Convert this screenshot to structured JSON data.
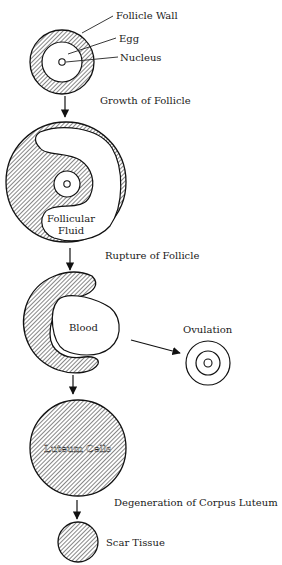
{
  "diagram": {
    "type": "ovarian-follicle-cycle",
    "colors": {
      "ink": "#1a1a1a",
      "background": "#ffffff"
    },
    "stage1": {
      "labels": {
        "follicle_wall": "Follicle Wall",
        "egg": "Egg",
        "nucleus": "Nucleus"
      }
    },
    "transitions": {
      "growth": "Growth of Follicle",
      "rupture": "Rupture of Follicle",
      "degeneration": "Degeneration of Corpus Luteum"
    },
    "stage2": {
      "fluid_label_line1": "Follicular",
      "fluid_label_line2": "Fluid"
    },
    "stage3": {
      "blood_label": "Blood",
      "ovulation_label": "Ovulation"
    },
    "stage4": {
      "cells_label": "Luteum Cells"
    },
    "stage5": {
      "scar_label": "Scar Tissue"
    }
  }
}
